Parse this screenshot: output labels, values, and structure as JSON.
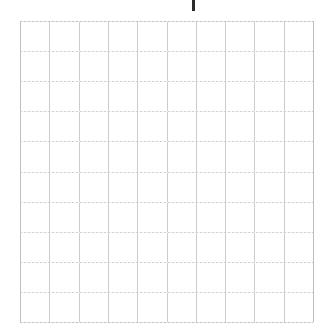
{
  "page": {
    "background_color": "#ffffff",
    "width": 331,
    "height": 333
  },
  "marker": {
    "name": "top-tick-mark",
    "label": "",
    "color": "#2b2b2b",
    "x": 192,
    "y": 0,
    "width": 3,
    "height": 11
  },
  "grid": {
    "label": "",
    "columns": 10,
    "rows": 10,
    "cell_width": 29.3,
    "cell_height": 30.1,
    "line_color": "#c9cbcd",
    "border_color": "#bcbec0",
    "background_color": "#ffffff",
    "x": 20,
    "y": 21,
    "width": 293,
    "height": 301,
    "cell_contents": [
      [
        "",
        "",
        "",
        "",
        "",
        "",
        "",
        "",
        "",
        ""
      ],
      [
        "",
        "",
        "",
        "",
        "",
        "",
        "",
        "",
        "",
        ""
      ],
      [
        "",
        "",
        "",
        "",
        "",
        "",
        "",
        "",
        "",
        ""
      ],
      [
        "",
        "",
        "",
        "",
        "",
        "",
        "",
        "",
        "",
        ""
      ],
      [
        "",
        "",
        "",
        "",
        "",
        "",
        "",
        "",
        "",
        ""
      ],
      [
        "",
        "",
        "",
        "",
        "",
        "",
        "",
        "",
        "",
        ""
      ],
      [
        "",
        "",
        "",
        "",
        "",
        "",
        "",
        "",
        "",
        ""
      ],
      [
        "",
        "",
        "",
        "",
        "",
        "",
        "",
        "",
        "",
        ""
      ],
      [
        "",
        "",
        "",
        "",
        "",
        "",
        "",
        "",
        "",
        ""
      ],
      [
        "",
        "",
        "",
        "",
        "",
        "",
        "",
        "",
        "",
        ""
      ]
    ]
  },
  "chart_data": {
    "type": "table",
    "title": "",
    "xlabel": "",
    "ylabel": "",
    "categories": [],
    "values": [],
    "grid": true,
    "legend": "none",
    "note": "Empty 10x10 graph-paper grid; no plotted data, no tick labels, no axis text."
  }
}
